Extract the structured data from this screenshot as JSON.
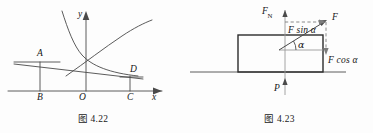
{
  "page": {
    "background_color": "#fdfdfd",
    "stroke_color": "#4a4a4a",
    "dark_stroke_color": "#2b2b2b",
    "text_color": "#161616"
  },
  "figures": [
    {
      "id": "fig-4-22",
      "caption": "图 4.22",
      "type": "math-graph",
      "axes": {
        "x_label": "x",
        "y_label": "y",
        "origin_label": "O"
      },
      "points": [
        {
          "name": "A",
          "label": "A"
        },
        {
          "name": "B",
          "label": "B"
        },
        {
          "name": "C",
          "label": "C"
        },
        {
          "name": "D",
          "label": "D"
        }
      ],
      "curves": [
        {
          "name": "decreasing-exponential-curve"
        },
        {
          "name": "increasing-curve"
        }
      ],
      "segments": [
        {
          "name": "segment-AB"
        },
        {
          "name": "segment-CD"
        },
        {
          "name": "segment-AD"
        },
        {
          "name": "horizontal-through-A"
        },
        {
          "name": "horizontal-through-D"
        }
      ]
    },
    {
      "id": "fig-4-23",
      "caption": "图 4.23",
      "type": "force-diagram",
      "forces": [
        {
          "name": "normal-force",
          "label": "F",
          "subscript": "N",
          "direction": "up"
        },
        {
          "name": "applied-force",
          "label": "F",
          "direction": "up-right"
        },
        {
          "name": "force-vertical-component",
          "label": "F sin α",
          "direction": "up"
        },
        {
          "name": "force-horizontal-component",
          "label": "F cos α",
          "direction": "right"
        },
        {
          "name": "weight-force",
          "label": "P",
          "direction": "up"
        }
      ],
      "angle": {
        "name": "alpha-angle",
        "label": "α"
      },
      "block": {
        "name": "rectangular-block"
      },
      "ground": {
        "name": "ground-line"
      }
    }
  ]
}
